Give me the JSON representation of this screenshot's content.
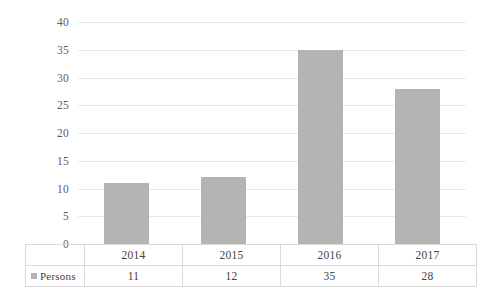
{
  "chart_data": {
    "type": "bar",
    "title": "",
    "xlabel": "",
    "ylabel": "",
    "categories": [
      "2014",
      "2015",
      "2016",
      "2017"
    ],
    "series": [
      {
        "name": "Persons",
        "values": [
          11,
          12,
          35,
          28
        ]
      }
    ],
    "ylim": [
      0,
      40
    ],
    "y_ticks": [
      "0",
      "5",
      "10",
      "15",
      "20",
      "25",
      "30",
      "35",
      "40"
    ],
    "grid": true,
    "legend_position": "data-table-left",
    "bar_color": "#b4b4b4",
    "gridline_color": "#e9e9e9",
    "table_border_color": "#dadada",
    "axis_text_color": "#5d5d5d",
    "data_table": {
      "visible": true,
      "legend_label": "Persons",
      "legend_marker": "square-marker-icon",
      "header_row": [
        "2014",
        "2015",
        "2016",
        "2017"
      ],
      "value_row": [
        "11",
        "12",
        "35",
        "28"
      ]
    }
  }
}
